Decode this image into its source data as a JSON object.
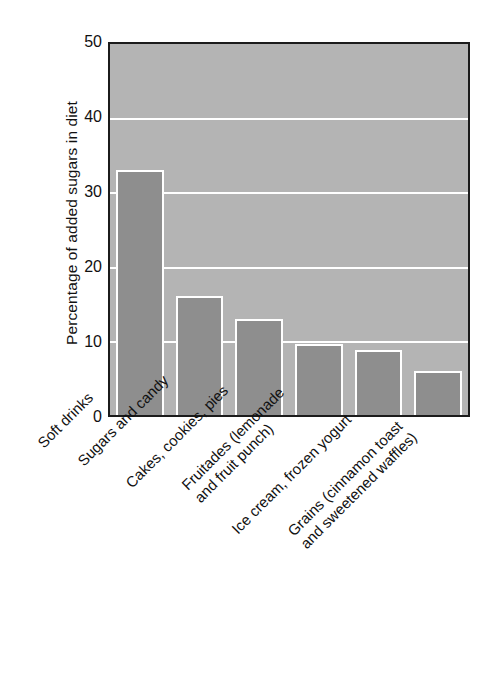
{
  "chart_data": {
    "type": "bar",
    "title": "",
    "xlabel": "",
    "ylabel": "Percentage of added sugars in diet",
    "categories": [
      "Soft drinks",
      "Sugars and candy",
      "Cakes, cookies, pies",
      "Fruitades (lemonade and fruit punch)",
      "Ice cream, frozen yogurt",
      "Grains (cinnamon toast and sweetened waffles)"
    ],
    "category_lines": [
      [
        "Soft drinks"
      ],
      [
        "Sugars and candy"
      ],
      [
        "Cakes, cookies, pies"
      ],
      [
        "Fruitades (lemonade",
        "and fruit punch)"
      ],
      [
        "Ice cream, frozen yogurt"
      ],
      [
        "Grains (cinnamon toast",
        "and sweetened waffles)"
      ]
    ],
    "values": [
      33,
      16,
      13,
      9.6,
      8.7,
      5.9
    ],
    "ylim": [
      0,
      50
    ],
    "yticks": [
      0,
      10,
      20,
      30,
      40,
      50
    ],
    "ytick_labels": [
      "0",
      "10",
      "20",
      "30",
      "40",
      "50"
    ],
    "gridlines": [
      10,
      20,
      30,
      40
    ],
    "grid": true,
    "legend": null,
    "colors": {
      "bar_fill": "#8e8e8e",
      "bar_edge": "#ffffff",
      "plot_background": "#b4b4b4",
      "gridline": "#ffffff",
      "axis_frame": "#1b1b1b",
      "text": "#111111",
      "figure_background": "#ffffff"
    }
  }
}
